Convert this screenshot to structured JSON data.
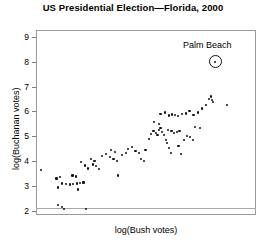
{
  "chart_data": {
    "type": "scatter",
    "title": "US Presidential Election—Florida, 2000",
    "xlabel": "log(Bush votes)",
    "ylabel": "log(Buchanan votes)",
    "grid": false,
    "legend": null,
    "ylim": [
      1.85,
      9.3
    ],
    "xlim": [
      0,
      1
    ],
    "yticks": [
      2,
      3,
      4,
      5,
      6,
      7,
      8,
      9
    ],
    "ytick_labels": [
      "2",
      "3",
      "4",
      "5",
      "6",
      "7",
      "8",
      "9"
    ],
    "xticks": [],
    "xtick_labels": [],
    "annotations": [
      {
        "label": "Palm Beach",
        "marker": "circled-point",
        "x": 0.814,
        "y": 8.02
      }
    ],
    "points": [
      {
        "x": 0.021,
        "y": 3.66
      },
      {
        "x": 0.1,
        "y": 2.24
      },
      {
        "x": 0.12,
        "y": 2.16
      },
      {
        "x": 0.128,
        "y": 2.1
      },
      {
        "x": 0.093,
        "y": 3.32
      },
      {
        "x": 0.108,
        "y": 3.38
      },
      {
        "x": 0.099,
        "y": 2.96
      },
      {
        "x": 0.12,
        "y": 3.12
      },
      {
        "x": 0.136,
        "y": 3.1
      },
      {
        "x": 0.155,
        "y": 3.08
      },
      {
        "x": 0.17,
        "y": 3.1
      },
      {
        "x": 0.186,
        "y": 3.12
      },
      {
        "x": 0.2,
        "y": 3.14
      },
      {
        "x": 0.216,
        "y": 3.16
      },
      {
        "x": 0.226,
        "y": 2.08
      },
      {
        "x": 0.166,
        "y": 3.44
      },
      {
        "x": 0.18,
        "y": 3.4
      },
      {
        "x": 0.192,
        "y": 2.88
      },
      {
        "x": 0.205,
        "y": 3.98
      },
      {
        "x": 0.222,
        "y": 3.84
      },
      {
        "x": 0.238,
        "y": 3.72
      },
      {
        "x": 0.258,
        "y": 3.88
      },
      {
        "x": 0.274,
        "y": 3.82
      },
      {
        "x": 0.286,
        "y": 3.7
      },
      {
        "x": 0.25,
        "y": 4.12
      },
      {
        "x": 0.266,
        "y": 4.02
      },
      {
        "x": 0.3,
        "y": 4.22
      },
      {
        "x": 0.318,
        "y": 4.3
      },
      {
        "x": 0.335,
        "y": 4.18
      },
      {
        "x": 0.352,
        "y": 4.1
      },
      {
        "x": 0.368,
        "y": 4.04
      },
      {
        "x": 0.34,
        "y": 4.48
      },
      {
        "x": 0.358,
        "y": 4.4
      },
      {
        "x": 0.374,
        "y": 3.44
      },
      {
        "x": 0.392,
        "y": 4.28
      },
      {
        "x": 0.408,
        "y": 4.36
      },
      {
        "x": 0.42,
        "y": 4.52
      },
      {
        "x": 0.438,
        "y": 4.6
      },
      {
        "x": 0.452,
        "y": 4.44
      },
      {
        "x": 0.468,
        "y": 4.34
      },
      {
        "x": 0.478,
        "y": 4.12
      },
      {
        "x": 0.49,
        "y": 4.02
      },
      {
        "x": 0.498,
        "y": 4.46
      },
      {
        "x": 0.512,
        "y": 4.92
      },
      {
        "x": 0.524,
        "y": 5.1
      },
      {
        "x": 0.534,
        "y": 5.22
      },
      {
        "x": 0.546,
        "y": 5.16
      },
      {
        "x": 0.552,
        "y": 5.06
      },
      {
        "x": 0.56,
        "y": 5.26
      },
      {
        "x": 0.566,
        "y": 5.34
      },
      {
        "x": 0.574,
        "y": 5.18
      },
      {
        "x": 0.582,
        "y": 5.08
      },
      {
        "x": 0.59,
        "y": 4.88
      },
      {
        "x": 0.596,
        "y": 4.74
      },
      {
        "x": 0.604,
        "y": 4.54
      },
      {
        "x": 0.612,
        "y": 4.36
      },
      {
        "x": 0.6,
        "y": 5.28
      },
      {
        "x": 0.616,
        "y": 5.22
      },
      {
        "x": 0.628,
        "y": 5.16
      },
      {
        "x": 0.64,
        "y": 5.2
      },
      {
        "x": 0.652,
        "y": 5.24
      },
      {
        "x": 0.648,
        "y": 4.62
      },
      {
        "x": 0.66,
        "y": 4.3
      },
      {
        "x": 0.672,
        "y": 4.88
      },
      {
        "x": 0.686,
        "y": 5.02
      },
      {
        "x": 0.7,
        "y": 5.0
      },
      {
        "x": 0.714,
        "y": 4.86
      },
      {
        "x": 0.566,
        "y": 5.92
      },
      {
        "x": 0.586,
        "y": 5.98
      },
      {
        "x": 0.604,
        "y": 5.86
      },
      {
        "x": 0.618,
        "y": 5.9
      },
      {
        "x": 0.632,
        "y": 5.88
      },
      {
        "x": 0.646,
        "y": 5.84
      },
      {
        "x": 0.664,
        "y": 5.92
      },
      {
        "x": 0.68,
        "y": 5.94
      },
      {
        "x": 0.698,
        "y": 6.04
      },
      {
        "x": 0.716,
        "y": 5.88
      },
      {
        "x": 0.736,
        "y": 5.98
      },
      {
        "x": 0.754,
        "y": 6.14
      },
      {
        "x": 0.772,
        "y": 6.28
      },
      {
        "x": 0.786,
        "y": 6.52
      },
      {
        "x": 0.796,
        "y": 6.62
      },
      {
        "x": 0.8,
        "y": 6.48
      },
      {
        "x": 0.806,
        "y": 6.4
      },
      {
        "x": 0.87,
        "y": 6.28
      },
      {
        "x": 0.536,
        "y": 5.6
      },
      {
        "x": 0.56,
        "y": 5.52
      },
      {
        "x": 0.724,
        "y": 5.4
      },
      {
        "x": 0.744,
        "y": 5.34
      }
    ]
  }
}
